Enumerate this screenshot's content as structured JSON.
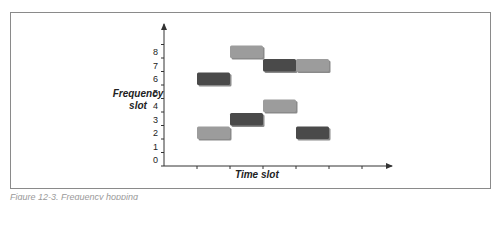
{
  "figure": {
    "y_axis_label_line1": "Frequency",
    "y_axis_label_line2": "slot",
    "x_axis_label": "Time slot",
    "caption": "Figure 12-3. Frequency hopping"
  },
  "colors": {
    "dark_bar": "#4a4a4a",
    "light_bar": "#9c9c9c",
    "axis": "#333333",
    "frame": "#8a8a8a"
  },
  "y_ticks": [
    "0",
    "1",
    "2",
    "3",
    "4",
    "5",
    "6",
    "7",
    "8"
  ],
  "bars": [
    {
      "time_slot": 1,
      "freq_slot": 6,
      "shade": "dark"
    },
    {
      "time_slot": 1,
      "freq_slot": 2,
      "shade": "light"
    },
    {
      "time_slot": 2,
      "freq_slot": 8,
      "shade": "light"
    },
    {
      "time_slot": 2,
      "freq_slot": 3,
      "shade": "dark"
    },
    {
      "time_slot": 3,
      "freq_slot": 7,
      "shade": "dark"
    },
    {
      "time_slot": 3,
      "freq_slot": 4,
      "shade": "light"
    },
    {
      "time_slot": 4,
      "freq_slot": 7,
      "shade": "light"
    },
    {
      "time_slot": 4,
      "freq_slot": 2,
      "shade": "dark"
    }
  ]
}
